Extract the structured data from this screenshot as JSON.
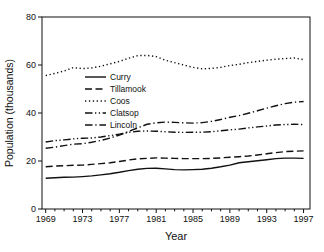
{
  "figure": {
    "background": "#ffffff",
    "line_color": "#111111"
  },
  "chart_data": {
    "type": "line",
    "title": "",
    "xlabel": "Year",
    "ylabel": "Population (thousands)",
    "xlim": [
      1968.6,
      1997.7
    ],
    "ylim": [
      0,
      80
    ],
    "x_major_ticks": [
      1969,
      1973,
      1977,
      1981,
      1985,
      1989,
      1993,
      1997
    ],
    "x_minor_tick_step": 1,
    "y_major_ticks": [
      0,
      20,
      40,
      60,
      80
    ],
    "grid": false,
    "legend_position": "inside-upper-left",
    "x": [
      1969,
      1970,
      1971,
      1972,
      1973,
      1974,
      1975,
      1976,
      1977,
      1978,
      1979,
      1980,
      1981,
      1982,
      1983,
      1984,
      1985,
      1986,
      1987,
      1988,
      1989,
      1990,
      1991,
      1992,
      1993,
      1994,
      1995,
      1996,
      1997
    ],
    "series": [
      {
        "name": "Curry",
        "line_style": "solid",
        "values": [
          12.8,
          13.0,
          13.2,
          13.3,
          13.5,
          13.8,
          14.2,
          14.7,
          15.3,
          16.0,
          16.6,
          16.9,
          17.0,
          16.7,
          16.4,
          16.3,
          16.4,
          16.6,
          17.0,
          17.6,
          18.3,
          19.3,
          19.7,
          20.1,
          20.5,
          21.0,
          21.2,
          21.2,
          21.1
        ]
      },
      {
        "name": "Tillamook",
        "line_style": "dashed",
        "values": [
          17.6,
          17.9,
          18.0,
          18.2,
          18.3,
          18.6,
          18.9,
          19.3,
          19.8,
          20.4,
          20.9,
          21.1,
          21.3,
          21.2,
          21.1,
          21.0,
          21.0,
          21.0,
          21.1,
          21.3,
          21.6,
          21.8,
          22.1,
          22.5,
          23.0,
          23.5,
          23.9,
          24.1,
          24.2
        ]
      },
      {
        "name": "Coos",
        "line_style": "dotted",
        "values": [
          55.6,
          56.5,
          57.5,
          58.9,
          58.5,
          58.8,
          59.5,
          60.5,
          61.5,
          62.8,
          63.9,
          64.0,
          63.5,
          62.0,
          61.0,
          60.0,
          59.0,
          58.4,
          58.6,
          59.0,
          59.8,
          60.3,
          61.0,
          61.5,
          62.0,
          62.4,
          62.7,
          62.9,
          62.2
        ]
      },
      {
        "name": "Clatsop",
        "line_style": "dash-dot-dot",
        "values": [
          27.9,
          28.5,
          28.8,
          29.2,
          29.5,
          29.6,
          30.0,
          30.6,
          31.2,
          31.9,
          32.4,
          32.5,
          32.4,
          32.2,
          32.0,
          31.9,
          32.0,
          32.0,
          32.2,
          32.6,
          33.0,
          33.3,
          33.8,
          34.2,
          34.6,
          35.0,
          35.2,
          35.3,
          35.2
        ]
      },
      {
        "name": "Lincoln",
        "line_style": "dash-dot",
        "values": [
          25.3,
          25.8,
          26.4,
          27.0,
          27.2,
          27.8,
          28.6,
          29.6,
          30.8,
          32.3,
          33.8,
          35.3,
          35.9,
          36.2,
          36.1,
          35.9,
          35.8,
          36.0,
          36.5,
          37.3,
          38.2,
          38.9,
          39.9,
          40.9,
          42.0,
          43.0,
          43.9,
          44.5,
          44.8
        ]
      }
    ]
  }
}
